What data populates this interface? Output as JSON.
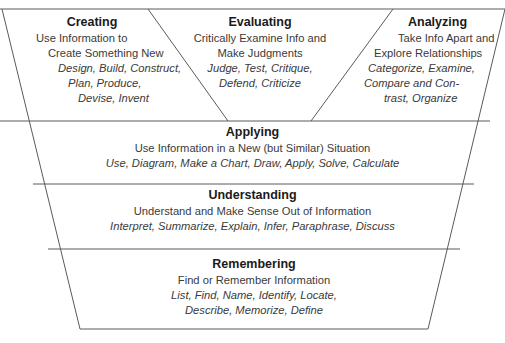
{
  "diagram": {
    "type": "inverted-pyramid",
    "line_color": "#555555",
    "levels": {
      "creating": {
        "title": "Creating",
        "desc_lines": [
          "Use Information to",
          "Create Something New"
        ],
        "verb_lines": [
          "Design, Build, Construct,",
          "Plan, Produce,",
          "Devise, Invent"
        ]
      },
      "evaluating": {
        "title": "Evaluating",
        "desc_lines": [
          "Critically Examine Info and",
          "Make Judgments"
        ],
        "verb_lines": [
          "Judge, Test, Critique,",
          "Defend, Criticize"
        ]
      },
      "analyzing": {
        "title": "Analyzing",
        "desc_lines": [
          "Take Info Apart and",
          "Explore Relationships"
        ],
        "verb_lines": [
          "Categorize, Examine,",
          "Compare and Con-",
          "trast, Organize"
        ]
      },
      "applying": {
        "title": "Applying",
        "desc_lines": [
          "Use Information in a New (but Similar) Situation"
        ],
        "verb_lines": [
          "Use, Diagram, Make a Chart, Draw, Apply, Solve, Calculate"
        ]
      },
      "understanding": {
        "title": "Understanding",
        "desc_lines": [
          "Understand and Make Sense Out of Information"
        ],
        "verb_lines": [
          "Interpret, Summarize, Explain, Infer, Paraphrase, Discuss"
        ]
      },
      "remembering": {
        "title": "Remembering",
        "desc_lines": [
          "Find or Remember Information"
        ],
        "verb_lines": [
          "List, Find, Name, Identify, Locate,",
          "Describe, Memorize, Define"
        ]
      }
    }
  }
}
